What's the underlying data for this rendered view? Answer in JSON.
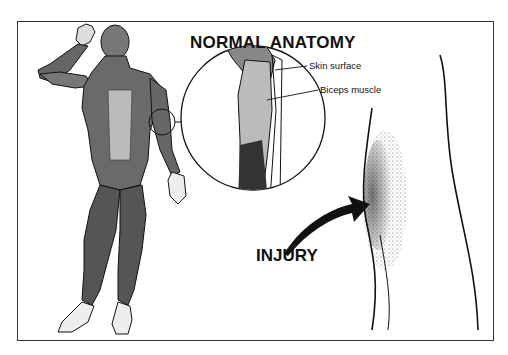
{
  "illustration": {
    "title": "NORMAL ANATOMY",
    "callouts": [
      {
        "label": "Skin surface"
      },
      {
        "label": "Biceps muscle"
      }
    ],
    "injury_label": "INJURY",
    "colors": {
      "ink": "#111111",
      "background": "#ffffff",
      "frame": "#333333"
    }
  }
}
